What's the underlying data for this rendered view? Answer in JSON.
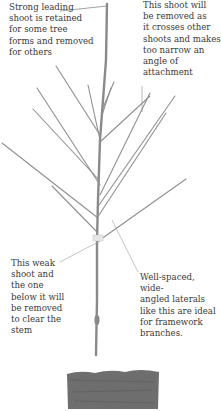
{
  "diagram": {
    "annotations": [
      {
        "id": "leader",
        "text": "Strong leading\nshoot is retained\nfor some tree\nforms and removed\nfor others"
      },
      {
        "id": "crossing",
        "text": "This shoot will\nbe removed as\nit crosses other\nshoots and makes\ntoo narrow an\nangle of\nattachment"
      },
      {
        "id": "weak",
        "text": "This weak\nshoot and\nthe one\nbelow it will\nbe removed\nto clear the\nstem"
      },
      {
        "id": "laterals",
        "text": "Well-spaced, wide-\nangled laterals\nlike this are ideal\nfor framework\nbranches."
      }
    ],
    "colors": {
      "branch": "#8a8a8a",
      "trunk": "#9a9a9a",
      "leader_line": "#7a7a7a",
      "soil": "#6e6e6e",
      "text": "#3a3a3a"
    }
  }
}
